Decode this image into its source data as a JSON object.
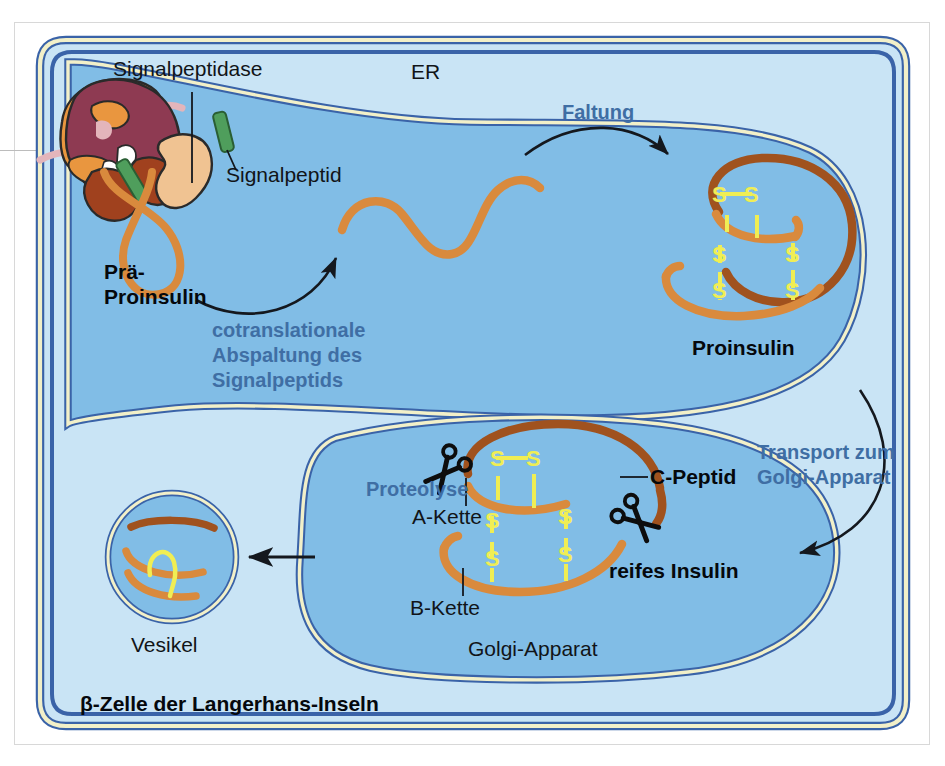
{
  "figure": {
    "cell_caption": "β-Zelle der Langerhans-Inseln"
  },
  "labels": {
    "signalpeptidase": "Signalpeptidase",
    "er": "ER",
    "signalpeptid": "Signalpeptid",
    "prae_proinsulin_line1": "Prä-",
    "prae_proinsulin_line2": "Proinsulin",
    "cotranslational_line1": "cotranslationale",
    "cotranslational_line2": "Abspaltung des",
    "cotranslational_line3": "Signalpeptids",
    "faltung": "Faltung",
    "proinsulin": "Proinsulin",
    "transport_line1": "Transport zum",
    "transport_line2": "Golgi-Apparat",
    "proteolyse": "Proteolyse",
    "a_kette": "A-Kette",
    "b_kette": "B-Kette",
    "c_peptid": "C-Peptid",
    "reifes_insulin": "reifes Insulin",
    "golgi": "Golgi-Apparat",
    "vesikel": "Vesikel"
  },
  "bonds": {
    "s": "S"
  },
  "icons": {
    "scissors_upper": "scissors-icon",
    "scissors_lower": "scissors-icon",
    "arrow_cotranslational": "curved-arrow-icon",
    "arrow_faltung": "curved-arrow-icon",
    "arrow_transport": "curved-arrow-icon",
    "arrow_vesicle": "straight-arrow-icon",
    "ribosome": "ribosome-icon",
    "signal_peptidase_enzyme": "enzyme-icon",
    "signal_peptide_green": "signal-peptide-icon"
  },
  "colors": {
    "cytoplasm": "#c9e4f5",
    "organelle_lumen": "#81bde6",
    "membrane_outer": "#3a63a8",
    "membrane_core": "#f2f0c9",
    "peptide_chain": "#d98a3d",
    "peptide_chain_dark": "#a0521e",
    "disulfide": "#f0ee54",
    "ribosome_large": "#8e3a52",
    "ribosome_rim": "#e9963f",
    "ribosome_small": "#a0411e",
    "enzyme_tan": "#f0c392",
    "signal_peptide_green": "#4f9e5c",
    "label_blue": "#3f6ea4",
    "label_black": "#111418",
    "page_background": "#ffffff"
  },
  "disulfide_bonds": [
    {
      "id": "bond-top-horizontal",
      "label": "S—S"
    },
    {
      "id": "bond-left-vertical",
      "label": "S⋯S"
    },
    {
      "id": "bond-right-vertical",
      "label": "S⋯S"
    }
  ]
}
